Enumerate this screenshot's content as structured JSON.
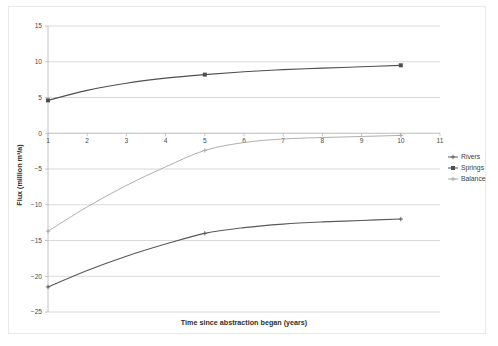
{
  "figure": {
    "kind": "line-chart-figure",
    "background": "#ffffff",
    "frame_color": "#e9e9e9"
  },
  "chart_data": {
    "type": "line",
    "title": "",
    "subtitle": "",
    "xlabel": "Time since abstraction began (years)",
    "ylabel": "Flux (million m³/a)",
    "xlim": [
      1,
      11
    ],
    "ylim": [
      -25,
      15
    ],
    "xticks": [
      1,
      2,
      3,
      4,
      5,
      6,
      7,
      8,
      9,
      10,
      11
    ],
    "xtick_labels": [
      "1",
      "2",
      "3",
      "4",
      "5",
      "6",
      "7",
      "8",
      "9",
      "10",
      "11"
    ],
    "yticks": [
      15,
      10,
      5,
      0,
      -5,
      -10,
      -15,
      -20,
      -25
    ],
    "ytick_labels": [
      "15",
      "10",
      "5",
      "0",
      "−5",
      "−10",
      "−15",
      "−20",
      "−25"
    ],
    "grid": "horizontal",
    "legend_position": "right",
    "x": [
      1,
      2,
      3,
      4,
      5,
      6,
      7,
      8,
      9,
      10
    ],
    "series": [
      {
        "name": "Rivers",
        "color": "#595959",
        "marker": "plus",
        "values": [
          -21.5,
          -19.2,
          -17.2,
          -15.5,
          -14.0,
          -13.2,
          -12.7,
          -12.4,
          -12.2,
          -12.0
        ]
      },
      {
        "name": "Springs",
        "color": "#4f4f4f",
        "marker": "square",
        "values": [
          4.6,
          6.0,
          7.0,
          7.7,
          8.2,
          8.6,
          8.9,
          9.1,
          9.3,
          9.5
        ]
      },
      {
        "name": "Balance",
        "color": "#a6a6a6",
        "marker": "plus",
        "values": [
          -13.7,
          -10.3,
          -7.3,
          -4.7,
          -2.4,
          -1.3,
          -0.8,
          -0.6,
          -0.45,
          -0.3
        ]
      }
    ]
  },
  "legend": {
    "entries": [
      {
        "label": "Rivers",
        "color": "#595959",
        "marker": "plus"
      },
      {
        "label": "Springs",
        "color": "#4f4f4f",
        "marker": "square"
      },
      {
        "label": "Balance",
        "color": "#a6a6a6",
        "marker": "plus"
      }
    ]
  }
}
